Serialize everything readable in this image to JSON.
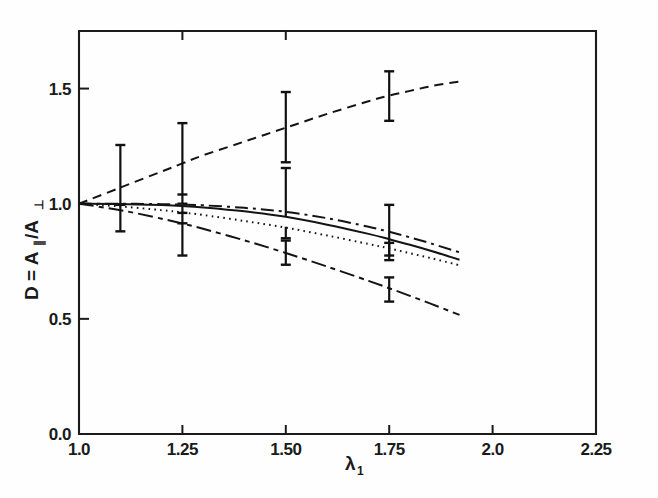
{
  "figure": {
    "background_color": "#ffffff",
    "ink_color": "#141414"
  },
  "chart_data": {
    "type": "line",
    "title": "",
    "subtitle": "",
    "xlabel": "λ",
    "xlabel_sub": "1",
    "ylabel": "D = A",
    "ylabel_par": "∥",
    "ylabel_div": "/A",
    "ylabel_perp": "⊥",
    "xlim": [
      1.0,
      2.25
    ],
    "ylim": [
      0.0,
      1.75
    ],
    "grid": false,
    "legend": "none",
    "xticks": [
      1.0,
      1.25,
      1.5,
      1.75,
      2.0,
      2.25
    ],
    "xtick_labels": [
      "1.0",
      "1.25",
      "1.50",
      "1.75",
      "2.0",
      "2.25"
    ],
    "yticks": [
      0.0,
      0.5,
      1.0,
      1.5
    ],
    "ytick_labels": [
      "0.0",
      "0.5",
      "1.0",
      "1.5"
    ],
    "series": [
      {
        "name": "dashed-upper",
        "style": "dashed",
        "x": [
          1.0,
          1.1,
          1.2,
          1.25,
          1.3,
          1.4,
          1.5,
          1.6,
          1.7,
          1.75,
          1.8,
          1.85,
          1.9,
          1.92
        ],
        "values": [
          1.0,
          1.07,
          1.14,
          1.175,
          1.21,
          1.27,
          1.33,
          1.39,
          1.445,
          1.47,
          1.49,
          1.51,
          1.525,
          1.53
        ]
      },
      {
        "name": "dash-dot-upper",
        "style": "dash-dot",
        "x": [
          1.0,
          1.1,
          1.2,
          1.25,
          1.3,
          1.4,
          1.5,
          1.6,
          1.7,
          1.75,
          1.8,
          1.85,
          1.9,
          1.92
        ],
        "values": [
          1.0,
          1.0,
          0.998,
          0.996,
          0.993,
          0.982,
          0.965,
          0.937,
          0.9,
          0.878,
          0.854,
          0.828,
          0.8,
          0.789
        ]
      },
      {
        "name": "solid",
        "style": "solid",
        "x": [
          1.0,
          1.1,
          1.2,
          1.25,
          1.3,
          1.4,
          1.5,
          1.6,
          1.7,
          1.75,
          1.8,
          1.85,
          1.9,
          1.92
        ],
        "values": [
          1.0,
          0.999,
          0.994,
          0.99,
          0.984,
          0.967,
          0.943,
          0.909,
          0.869,
          0.846,
          0.822,
          0.796,
          0.768,
          0.757
        ]
      },
      {
        "name": "dotted",
        "style": "dotted",
        "x": [
          1.0,
          1.1,
          1.2,
          1.25,
          1.3,
          1.4,
          1.5,
          1.6,
          1.7,
          1.75,
          1.8,
          1.85,
          1.9,
          1.92
        ],
        "values": [
          1.0,
          0.988,
          0.972,
          0.962,
          0.951,
          0.925,
          0.896,
          0.862,
          0.825,
          0.806,
          0.785,
          0.764,
          0.742,
          0.733
        ]
      },
      {
        "name": "dash-dot-lower",
        "style": "long-dash-short-dash",
        "x": [
          1.0,
          1.1,
          1.2,
          1.25,
          1.3,
          1.4,
          1.5,
          1.6,
          1.7,
          1.75,
          1.8,
          1.85,
          1.9,
          1.92
        ],
        "values": [
          1.0,
          0.972,
          0.935,
          0.914,
          0.891,
          0.841,
          0.786,
          0.727,
          0.665,
          0.633,
          0.6,
          0.566,
          0.531,
          0.517
        ]
      }
    ],
    "error_points": [
      {
        "x": 1.1,
        "y": 1.07,
        "err_low": 0.19,
        "err_high": 0.185
      },
      {
        "x": 1.1,
        "y": 0.995,
        "err_low": 0.0,
        "err_high": 0.0
      },
      {
        "x": 1.25,
        "y": 1.175,
        "err_low": 0.175,
        "err_high": 0.175
      },
      {
        "x": 1.25,
        "y": 1.04,
        "err_low": 0.0,
        "err_high": 0.0
      },
      {
        "x": 1.25,
        "y": 0.99,
        "err_low": 0.215,
        "err_high": 0.0
      },
      {
        "x": 1.25,
        "y": 0.96,
        "err_low": 0.0,
        "err_high": 0.0
      },
      {
        "x": 1.25,
        "y": 0.915,
        "err_low": 0.0,
        "err_high": 0.0
      },
      {
        "x": 1.5,
        "y": 1.335,
        "err_low": 0.155,
        "err_high": 0.15
      },
      {
        "x": 1.5,
        "y": 0.945,
        "err_low": 0.0,
        "err_high": 0.21
      },
      {
        "x": 1.5,
        "y": 0.9,
        "err_low": 0.05,
        "err_high": 0.0
      },
      {
        "x": 1.5,
        "y": 0.79,
        "err_low": 0.055,
        "err_high": 0.05
      },
      {
        "x": 1.75,
        "y": 1.47,
        "err_low": 0.11,
        "err_high": 0.105
      },
      {
        "x": 1.75,
        "y": 0.85,
        "err_low": 0.095,
        "err_high": 0.145
      },
      {
        "x": 1.75,
        "y": 0.805,
        "err_low": 0.03,
        "err_high": 0.025
      },
      {
        "x": 1.75,
        "y": 0.63,
        "err_low": 0.055,
        "err_high": 0.05
      }
    ]
  }
}
